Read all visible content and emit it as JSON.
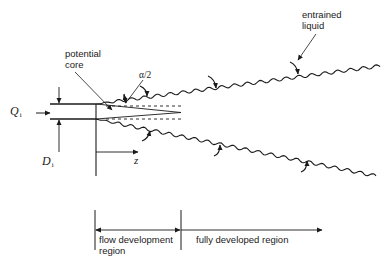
{
  "figure": {
    "type": "schematic",
    "labels": {
      "flow_rate_symbol": "Q",
      "flow_rate_subscript": "i",
      "diameter_symbol": "D",
      "diameter_subscript": "i",
      "axial_coordinate": "z",
      "half_angle": "α/2",
      "potential_core_line1": "potential",
      "potential_core_line2": "core",
      "entrained_line1": "entrained",
      "entrained_line2": "liquid"
    },
    "regions": [
      {
        "line1": "flow development",
        "line2": "region"
      },
      {
        "line1": "fully developed region",
        "line2": ""
      }
    ],
    "colors": {
      "ink": "#1a1a1a",
      "background": "#ffffff"
    }
  }
}
